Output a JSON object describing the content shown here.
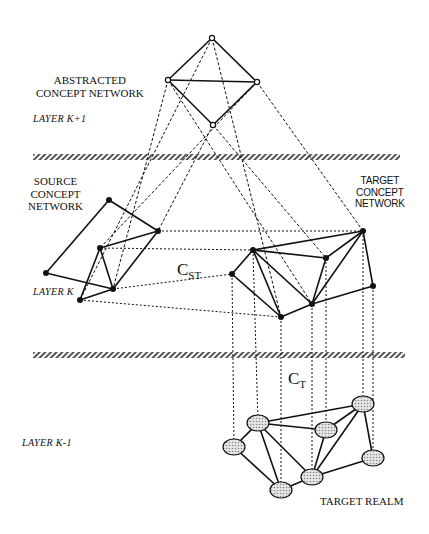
{
  "labels": {
    "abstracted": [
      "ABSTRACTED",
      "CONCEPT NETWORK"
    ],
    "layer_k_plus_1": "LAYER  K+1",
    "source": [
      "SOURCE",
      "CONCEPT",
      "NETWORK"
    ],
    "target": [
      "TARGET",
      "CONCEPT",
      "NETWORK"
    ],
    "layer_k": "LAYER  K",
    "c_st": {
      "main": "C",
      "sub": "ST"
    },
    "c_t": {
      "main": "C",
      "sub": "T"
    },
    "layer_k_minus_1": "LAYER  K-1",
    "target_realm": "TARGET REALM"
  },
  "colors": {
    "line": "#111111",
    "node": "#111111",
    "hatch": "#555555",
    "ellipse_fill": "#c8c8c8"
  },
  "separators": [
    {
      "y": 157,
      "x1": 33,
      "x2": 400
    },
    {
      "y": 355,
      "x1": 33,
      "x2": 405
    }
  ],
  "abstracted_network": {
    "nodes": [
      [
        212,
        38
      ],
      [
        168,
        80
      ],
      [
        257,
        82
      ],
      [
        213,
        125
      ]
    ],
    "edges": [
      [
        0,
        1
      ],
      [
        0,
        2
      ],
      [
        1,
        2
      ],
      [
        1,
        3
      ],
      [
        2,
        3
      ]
    ]
  },
  "source_network": {
    "nodes": [
      [
        109,
        200
      ],
      [
        158,
        231
      ],
      [
        100,
        248
      ],
      [
        46,
        273
      ],
      [
        113,
        289
      ],
      [
        80,
        300
      ]
    ],
    "edges": [
      [
        0,
        1
      ],
      [
        0,
        3
      ],
      [
        3,
        4
      ],
      [
        2,
        1
      ],
      [
        2,
        4
      ],
      [
        2,
        5
      ],
      [
        5,
        4
      ],
      [
        1,
        4
      ]
    ]
  },
  "target_network": {
    "nodes": [
      [
        363,
        231
      ],
      [
        253,
        250
      ],
      [
        326,
        258
      ],
      [
        232,
        274
      ],
      [
        373,
        286
      ],
      [
        312,
        304
      ],
      [
        281,
        317
      ]
    ],
    "edges": [
      [
        1,
        0
      ],
      [
        1,
        2
      ],
      [
        2,
        0
      ],
      [
        0,
        5
      ],
      [
        0,
        4
      ],
      [
        4,
        5
      ],
      [
        2,
        5
      ],
      [
        1,
        5
      ],
      [
        1,
        3
      ],
      [
        3,
        6
      ],
      [
        6,
        5
      ],
      [
        1,
        6
      ]
    ]
  },
  "target_realm": {
    "nodes": [
      [
        363,
        404
      ],
      [
        258,
        423
      ],
      [
        326,
        430
      ],
      [
        234,
        447
      ],
      [
        373,
        458
      ],
      [
        312,
        477
      ],
      [
        281,
        490
      ]
    ],
    "edges": [
      [
        1,
        0
      ],
      [
        1,
        2
      ],
      [
        2,
        0
      ],
      [
        0,
        5
      ],
      [
        0,
        4
      ],
      [
        4,
        5
      ],
      [
        2,
        5
      ],
      [
        1,
        5
      ],
      [
        1,
        3
      ],
      [
        3,
        6
      ],
      [
        6,
        5
      ],
      [
        1,
        6
      ]
    ]
  },
  "projections_top": [
    [
      [
        212,
        38
      ],
      [
        80,
        300
      ]
    ],
    [
      [
        212,
        38
      ],
      [
        281,
        317
      ]
    ],
    [
      [
        168,
        80
      ],
      [
        113,
        289
      ]
    ],
    [
      [
        168,
        80
      ],
      [
        312,
        304
      ]
    ],
    [
      [
        257,
        82
      ],
      [
        100,
        248
      ]
    ],
    [
      [
        257,
        82
      ],
      [
        363,
        231
      ]
    ],
    [
      [
        213,
        125
      ],
      [
        158,
        231
      ]
    ],
    [
      [
        213,
        125
      ],
      [
        326,
        258
      ]
    ]
  ],
  "correspondences_st": [
    [
      [
        158,
        231
      ],
      [
        363,
        231
      ]
    ],
    [
      [
        100,
        248
      ],
      [
        253,
        250
      ]
    ],
    [
      [
        113,
        289
      ],
      [
        232,
        274
      ]
    ],
    [
      [
        80,
        300
      ],
      [
        281,
        317
      ]
    ]
  ],
  "correspondences_t": [
    [
      [
        363,
        231
      ],
      [
        363,
        404
      ]
    ],
    [
      [
        253,
        250
      ],
      [
        258,
        423
      ]
    ],
    [
      [
        326,
        258
      ],
      [
        326,
        430
      ]
    ],
    [
      [
        232,
        274
      ],
      [
        234,
        447
      ]
    ],
    [
      [
        373,
        286
      ],
      [
        373,
        458
      ]
    ],
    [
      [
        312,
        304
      ],
      [
        312,
        477
      ]
    ],
    [
      [
        281,
        317
      ],
      [
        281,
        490
      ]
    ]
  ]
}
